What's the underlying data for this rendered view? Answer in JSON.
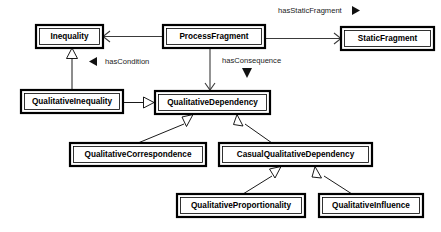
{
  "diagram": {
    "type": "uml-class-diagram",
    "title": "",
    "background_color": "#ffffff",
    "box_fill": "#ffffff",
    "box_stroke": "#000000",
    "line_color": "#3a3a3a",
    "classes": [
      {
        "id": "inequality",
        "label": "Inequality",
        "x": 36,
        "y": 25,
        "w": 67,
        "h": 23
      },
      {
        "id": "process_fragment",
        "label": "ProcessFragment",
        "x": 163,
        "y": 25,
        "w": 102,
        "h": 23
      },
      {
        "id": "static_fragment",
        "label": "StaticFragment",
        "x": 341,
        "y": 27,
        "w": 93,
        "h": 23
      },
      {
        "id": "qualitative_inequality",
        "label": "QualitativeInequality",
        "x": 21,
        "y": 90,
        "w": 102,
        "h": 23
      },
      {
        "id": "qualitative_dependency",
        "label": "QualitativeDependency",
        "x": 155,
        "y": 91,
        "w": 115,
        "h": 23
      },
      {
        "id": "qualitative_correspondence",
        "label": "QualitativeCorrespondence",
        "x": 70,
        "y": 143,
        "w": 136,
        "h": 23
      },
      {
        "id": "casual_qualitative_dependency",
        "label": "CasualQualitativeDependency",
        "x": 219,
        "y": 143,
        "w": 153,
        "h": 23
      },
      {
        "id": "qualitative_proportionality",
        "label": "QualitativeProportionality",
        "x": 177,
        "y": 194,
        "w": 128,
        "h": 23
      },
      {
        "id": "qualitative_influence",
        "label": "QualitativeInfluence",
        "x": 319,
        "y": 194,
        "w": 104,
        "h": 23
      }
    ],
    "associations": [
      {
        "id": "has_condition",
        "label": "hasCondition",
        "from": "process_fragment",
        "to": "inequality",
        "marker": "open-arrow",
        "label_marker": "triangle-left",
        "label_x": 105,
        "label_y": 61
      },
      {
        "id": "has_static_fragment",
        "label": "hasStaticFragment",
        "from": "process_fragment",
        "to": "static_fragment",
        "marker": "open-arrow",
        "label_marker": "triangle-right",
        "label_x": 278,
        "label_y": 10
      },
      {
        "id": "has_consequence",
        "label": "hasConsequence",
        "from": "process_fragment",
        "to": "qualitative_dependency",
        "marker": "open-arrow",
        "label_marker": "triangle-down",
        "label_x": 222,
        "label_y": 61
      }
    ],
    "generalizations": [
      {
        "id": "gen-qualineq-ineq",
        "from": "qualitative_inequality",
        "to": "inequality",
        "arrow_at": "inequality"
      },
      {
        "id": "gen-qualineq-qualdep",
        "from": "qualitative_inequality",
        "to": "qualitative_dependency",
        "arrow_at": "qualitative_dependency"
      },
      {
        "id": "gen-qualcorr-qualdep",
        "from": "qualitative_correspondence",
        "to": "qualitative_dependency",
        "arrow_at": "qualitative_dependency"
      },
      {
        "id": "gen-casual-qualdep",
        "from": "casual_qualitative_dependency",
        "to": "qualitative_dependency",
        "arrow_at": "qualitative_dependency"
      },
      {
        "id": "gen-qualprop-casual",
        "from": "qualitative_proportionality",
        "to": "casual_qualitative_dependency",
        "arrow_at": "casual_qualitative_dependency"
      },
      {
        "id": "gen-qualinf-casual",
        "from": "qualitative_influence",
        "to": "casual_qualitative_dependency",
        "arrow_at": "casual_qualitative_dependency"
      }
    ]
  }
}
